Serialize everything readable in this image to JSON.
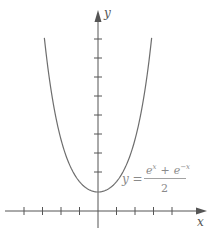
{
  "chart_data": {
    "type": "line",
    "title": "",
    "xlabel": "x",
    "ylabel": "y",
    "series": [
      {
        "name": "y = (e^x + e^-x)/2",
        "function": "cosh(x)",
        "x": [
          -2.9,
          -2.5,
          -2,
          -1.5,
          -1,
          -0.5,
          0,
          0.5,
          1,
          1.5,
          2,
          2.5,
          2.9
        ],
        "values": [
          9.12,
          6.13,
          3.76,
          2.35,
          1.54,
          1.13,
          1.0,
          1.13,
          1.54,
          2.35,
          3.76,
          6.13,
          9.12
        ]
      }
    ],
    "xlim": [
      -4.2,
      5.5
    ],
    "ylim": [
      -1.2,
      10.5
    ],
    "x_ticks": [
      -4,
      -3,
      -2,
      -1,
      1,
      2,
      3,
      4
    ],
    "y_ticks": [
      2,
      3,
      4,
      5,
      6,
      7,
      8,
      9
    ],
    "tick_labels_shown": false,
    "grid": false,
    "legend": "none",
    "annotations": [
      {
        "text": "y = (e^x + e^-x)/2",
        "position": "right of curve near minimum"
      }
    ]
  },
  "labels": {
    "x_axis": "x",
    "y_axis": "y",
    "equation_lhs": "y =",
    "equation_num_a": "e",
    "equation_num_a_sup": "x",
    "equation_plus": "+",
    "equation_num_b": "e",
    "equation_num_b_sup": "−x",
    "equation_den": "2"
  },
  "colors": {
    "axis": "#555555",
    "curve": "#6e6e6e",
    "equation": "#8a8a8a"
  }
}
